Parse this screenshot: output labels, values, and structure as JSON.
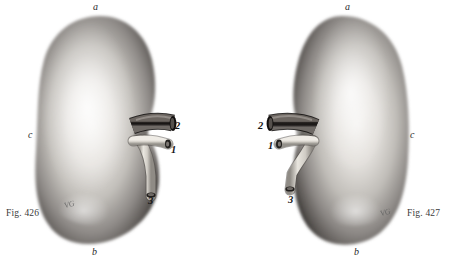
{
  "plate": {
    "background_color": "#ffffff",
    "width": 464,
    "height": 262
  },
  "figures": [
    {
      "id": "fig-426",
      "caption": "Fig. 426",
      "side": "left",
      "orientation": "hilum-right",
      "letters": [
        {
          "key": "a",
          "label": "a",
          "position": "top"
        },
        {
          "key": "b",
          "label": "b",
          "position": "bottom"
        },
        {
          "key": "c",
          "label": "c",
          "position": "left-border"
        }
      ],
      "numbers": [
        {
          "key": "1",
          "label": "1",
          "structure": "renal-artery"
        },
        {
          "key": "2",
          "label": "2",
          "structure": "renal-vein"
        },
        {
          "key": "3",
          "label": "3",
          "structure": "ureter"
        }
      ],
      "signature": "VG"
    },
    {
      "id": "fig-427",
      "caption": "Fig. 427",
      "side": "right",
      "orientation": "hilum-left",
      "letters": [
        {
          "key": "a",
          "label": "a",
          "position": "top"
        },
        {
          "key": "b",
          "label": "b",
          "position": "bottom"
        },
        {
          "key": "c",
          "label": "c",
          "position": "right-border"
        }
      ],
      "numbers": [
        {
          "key": "1",
          "label": "1",
          "structure": "renal-artery"
        },
        {
          "key": "2",
          "label": "2",
          "structure": "renal-vein"
        },
        {
          "key": "3",
          "label": "3",
          "structure": "ureter"
        }
      ],
      "signature": "VG"
    }
  ],
  "colors": {
    "organ_dark": "#4a4644",
    "organ_mid": "#9a9693",
    "organ_light": "#ebe9e6",
    "vein_dark": "#24201e",
    "artery_light": "#d8d5cf",
    "ureter_light": "#dedbd4",
    "label_text": "#1a1a1a",
    "caption_text": "#3a3a3a"
  }
}
